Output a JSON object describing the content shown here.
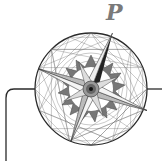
{
  "logo": {
    "letter": "P",
    "description": "compass rose emblem",
    "colors": {
      "stroke": "#2a2a2a",
      "fine_line": "#555555",
      "letter": "#7a7a7a",
      "background": "#ffffff"
    }
  }
}
